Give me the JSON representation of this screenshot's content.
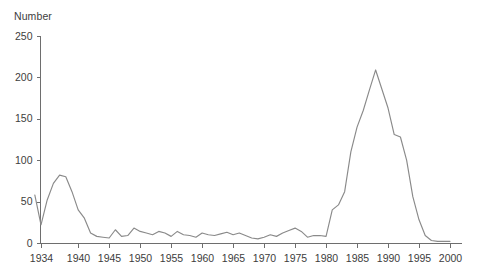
{
  "chart_data": {
    "type": "line",
    "title": "",
    "ylabel": "Number",
    "xlabel": "",
    "ylim": [
      0,
      250
    ],
    "xlim": [
      1932,
      2001
    ],
    "grid": false,
    "legend": null,
    "y_ticks": [
      0,
      50,
      100,
      150,
      200,
      250
    ],
    "x_ticks": [
      1934,
      1940,
      1945,
      1950,
      1955,
      1960,
      1965,
      1970,
      1975,
      1980,
      1985,
      1990,
      1995,
      2000
    ],
    "line_color": "#8a8a8a",
    "axis_color": "#6e6e6e",
    "series": [
      {
        "name": "Number",
        "x": [
          1933,
          1934,
          1935,
          1936,
          1937,
          1938,
          1939,
          1940,
          1941,
          1942,
          1943,
          1944,
          1945,
          1946,
          1947,
          1948,
          1949,
          1950,
          1951,
          1952,
          1953,
          1954,
          1955,
          1956,
          1957,
          1958,
          1959,
          1960,
          1961,
          1962,
          1963,
          1964,
          1965,
          1966,
          1967,
          1968,
          1969,
          1970,
          1971,
          1972,
          1973,
          1974,
          1975,
          1976,
          1977,
          1978,
          1979,
          1980,
          1981,
          1982,
          1983,
          1984,
          1985,
          1986,
          1987,
          1988,
          1989,
          1990,
          1991,
          1992,
          1993,
          1994,
          1995,
          1996,
          1997,
          1998,
          1999,
          2000
        ],
        "y": [
          58,
          22,
          52,
          72,
          82,
          80,
          62,
          40,
          30,
          12,
          8,
          7,
          6,
          16,
          8,
          9,
          18,
          14,
          12,
          10,
          14,
          12,
          8,
          14,
          10,
          9,
          7,
          12,
          10,
          9,
          11,
          13,
          10,
          12,
          9,
          6,
          5,
          7,
          10,
          8,
          12,
          15,
          18,
          14,
          7,
          9,
          9,
          8,
          40,
          46,
          62,
          110,
          140,
          160,
          185,
          209,
          186,
          163,
          131,
          128,
          100,
          56,
          28,
          9,
          3,
          2,
          2,
          2
        ]
      }
    ]
  },
  "axis_labels": {
    "y": [
      "0",
      "50",
      "100",
      "150",
      "200",
      "250"
    ],
    "x": [
      "1934",
      "1940",
      "1945",
      "1950",
      "1955",
      "1960",
      "1965",
      "1970",
      "1975",
      "1980",
      "1985",
      "1990",
      "1995",
      "2000"
    ]
  }
}
